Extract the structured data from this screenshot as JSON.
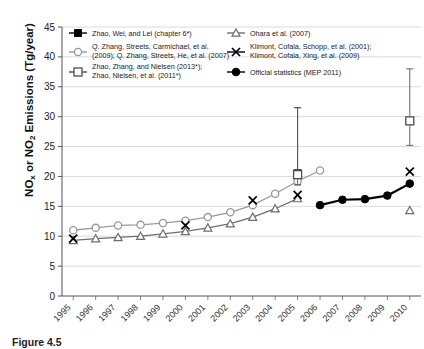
{
  "figure": {
    "caption": "Figure 4.5",
    "y_axis_label_main": "NO",
    "y_axis_label_sub1": "x",
    "y_axis_label_mid": " or NO",
    "y_axis_label_sub2": "2",
    "y_axis_label_end": " Emissions (Tg/year)"
  },
  "chart_data": {
    "type": "line",
    "title": "",
    "xlabel": "",
    "ylabel": "NOx or NO2 Emissions (Tg/year)",
    "xlim": [
      1995,
      2010
    ],
    "ylim": [
      0,
      45
    ],
    "ytick_step": 5,
    "yticks": [
      0,
      5,
      10,
      15,
      20,
      25,
      30,
      35,
      40,
      45
    ],
    "grid": "horizontal",
    "legend_position": "top-inside",
    "categories": [
      1995,
      1996,
      1997,
      1998,
      1999,
      2000,
      2001,
      2002,
      2003,
      2004,
      2005,
      2006,
      2007,
      2008,
      2009,
      2010
    ],
    "series": [
      {
        "name": "Zhao, Wei, and Lei (chapter 6*)",
        "marker": "filled-square",
        "color": "#000000",
        "x": [
          2005
        ],
        "values": [
          20.5
        ],
        "error_bars": [
          {
            "x": 2005,
            "y": 20.5,
            "low": 18.6,
            "high": 31.5
          }
        ]
      },
      {
        "name": "Q. Zhang, Streets, Carmichael, et al. (2009); Q. Zhang, Streets, He, et al. (2007)",
        "marker": "open-circle",
        "color": "#9a9a9a",
        "x": [
          1995,
          1996,
          1997,
          1998,
          1999,
          2000,
          2001,
          2002,
          2003,
          2004,
          2005,
          2006
        ],
        "values": [
          11.0,
          11.4,
          11.8,
          11.9,
          12.2,
          12.6,
          13.2,
          14.0,
          15.2,
          17.1,
          19.2,
          21.0
        ]
      },
      {
        "name": "Zhao, Zhang, and Nielsen (2013*); Zhao, Nielsen, et al. (2011*)",
        "marker": "open-square",
        "color": "#4d4d4d",
        "x": [
          2005,
          2010
        ],
        "values": [
          20.3,
          29.3
        ],
        "error_bars": [
          {
            "x": 2005,
            "y": 20.3,
            "low": 18.6,
            "high": 31.5
          },
          {
            "x": 2010,
            "y": 29.3,
            "low": 25.2,
            "high": 38.0
          }
        ]
      },
      {
        "name": "Ohara et al. (2007)",
        "marker": "open-triangle",
        "color": "#6e6e6e",
        "x": [
          1995,
          1996,
          1997,
          1998,
          1999,
          2000,
          2001,
          2002,
          2003,
          2004,
          2005,
          2010
        ],
        "values": [
          9.3,
          9.6,
          9.8,
          10.0,
          10.4,
          10.8,
          11.4,
          12.1,
          13.2,
          14.6,
          16.3,
          14.3
        ]
      },
      {
        "name": "Klimont, Cofala, Schopp, et al. (2001); Klimont, Cofala, Xing, et al. (2009)",
        "marker": "x-cross",
        "color": "#000000",
        "x": [
          1995,
          2000,
          2003,
          2005,
          2010
        ],
        "values": [
          9.6,
          11.8,
          16.0,
          16.9,
          20.8
        ]
      },
      {
        "name": "Official statistics (MEP 2011)",
        "marker": "filled-circle",
        "color": "#000000",
        "x": [
          2006,
          2007,
          2008,
          2009,
          2010
        ],
        "values": [
          15.2,
          16.1,
          16.2,
          16.8,
          18.8
        ]
      }
    ]
  },
  "legend": {
    "entries": [
      {
        "label": "Zhao, Wei, and Lei (chapter 6*)",
        "marker": "filled-square"
      },
      {
        "label_line1": "Q. Zhang, Streets, Carmichael, et al.",
        "label_line2": "(2009); Q. Zhang, Streets, He, et al. (2007)",
        "marker": "open-circle"
      },
      {
        "label_line1": "Zhao, Zhang, and Nielsen (2013*);",
        "label_line2": "Zhao, Nielsen, et al. (2011*)",
        "marker": "open-square"
      },
      {
        "label": "Ohara et al. (2007)",
        "marker": "open-triangle"
      },
      {
        "label_line1": "Klimont, Cofala, Schopp, et al. (2001);",
        "label_line2": "Klimont, Cofala, Xing, et al. (2009)",
        "marker": "x-cross"
      },
      {
        "label": "Official statistics (MEP 2011)",
        "marker": "filled-circle"
      }
    ]
  },
  "axis": {
    "x_tick_labels": [
      "1995",
      "1996",
      "1997",
      "1998",
      "1999",
      "2000",
      "2001",
      "2002",
      "2003",
      "2004",
      "2005",
      "2006",
      "2007",
      "2008",
      "2009",
      "2010"
    ],
    "y_tick_labels": [
      "0",
      "5",
      "10",
      "15",
      "20",
      "25",
      "30",
      "35",
      "40",
      "45"
    ]
  }
}
